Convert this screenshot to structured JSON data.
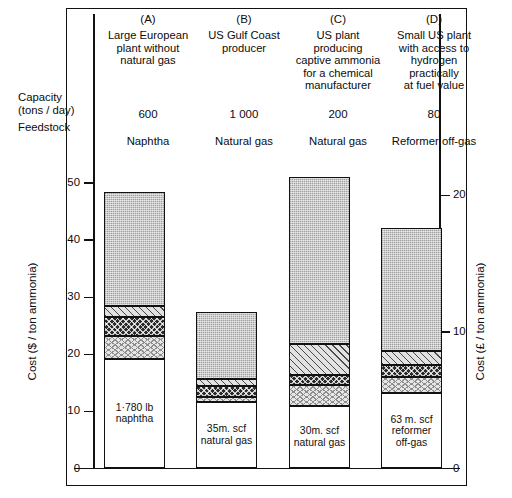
{
  "axes": {
    "left_title": "Cost ($ / ton ammonia)",
    "right_title": "Cost (£ / ton ammonia)",
    "left_ticks": [
      "0",
      "10",
      "20",
      "30",
      "40",
      "50"
    ],
    "right_ticks": [
      "0",
      "10",
      "20"
    ]
  },
  "row_labels": {
    "capacity": "Capacity",
    "capacity_units": "(tons / day)",
    "feedstock": "Feedstock"
  },
  "columns": [
    {
      "key": "(A)",
      "description": "Large European\nplant without\nnatural gas",
      "capacity": "600",
      "feedstock": "Naphtha",
      "base_label": "1·780 lb\nnaphtha"
    },
    {
      "key": "(B)",
      "description": "US Gulf Coast\nproducer",
      "capacity": "1 000",
      "feedstock": "Natural gas",
      "base_label": "35m. scf\nnatural gas"
    },
    {
      "key": "(C)",
      "description": "US plant\nproducing\ncaptive ammonia\nfor a chemical\nmanufacturer",
      "capacity": "200",
      "feedstock": "Natural gas",
      "base_label": "30m. scf\nnatural gas"
    },
    {
      "key": "(D)",
      "description": "Small US plant\nwith access to\nhydrogen\npractically\nat fuel value",
      "capacity": "80",
      "feedstock": "Reformer off-gas",
      "base_label": "63 m. scf\nreformer\noff-gas"
    }
  ],
  "chart_data": {
    "type": "bar",
    "subtype": "stacked",
    "title": "",
    "xlabel": "",
    "ylabel": "Cost ($ / ton ammonia)",
    "ylabel_secondary": "Cost (£ / ton ammonia)",
    "ylim": [
      0,
      55
    ],
    "ylim_secondary": [
      0,
      23
    ],
    "yticks": [
      0,
      10,
      20,
      30,
      40,
      50
    ],
    "yticks_secondary": [
      0,
      10,
      20
    ],
    "grid": false,
    "legend": "none",
    "categories": [
      "(A)",
      "(B)",
      "(C)",
      "(D)"
    ],
    "totals": [
      48.5,
      27.4,
      51.0,
      42.2
    ],
    "series": [
      {
        "name": "feedstock",
        "fill": "white",
        "values": [
          19.2,
          11.7,
          11.0,
          13.3
        ]
      },
      {
        "name": "utilities",
        "fill": "wave",
        "values": [
          4.0,
          0.8,
          3.6,
          2.8
        ]
      },
      {
        "name": "labour-and-overheads",
        "fill": "dark",
        "values": [
          3.4,
          1.9,
          1.7,
          2.1
        ]
      },
      {
        "name": "other-operating-costs",
        "fill": "diagonal",
        "values": [
          1.9,
          1.2,
          5.5,
          2.3
        ]
      },
      {
        "name": "capital-charges",
        "fill": "grey",
        "values": [
          20.0,
          11.8,
          29.2,
          21.7
        ]
      }
    ]
  }
}
